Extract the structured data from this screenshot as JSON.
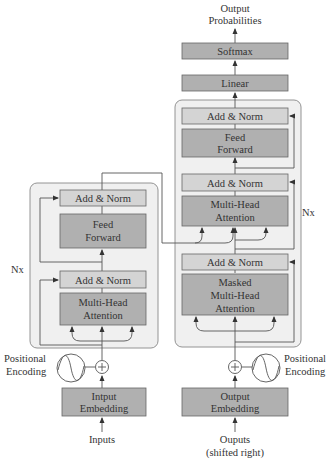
{
  "colors": {
    "stack_bg": "#f0f0f0",
    "light_block": "#d4d4d4",
    "dark_block": "#b0b0b0",
    "line": "#555555"
  },
  "top_output": {
    "line1": "Output",
    "line2": "Probabilities"
  },
  "decoder_head": {
    "softmax": "Softmax",
    "linear": "Linear"
  },
  "encoder": {
    "repeat_label": "Nx",
    "add_norm_top": "Add & Norm",
    "feed_forward": {
      "line1": "Feed",
      "line2": "Forward"
    },
    "add_norm_bottom": "Add & Norm",
    "attention": {
      "line1": "Multi-Head",
      "line2": "Attention"
    },
    "positional_encoding": {
      "line1": "Positional",
      "line2": "Encoding"
    },
    "embedding": {
      "line1": "Intput",
      "line2": "Embedding"
    },
    "input_label": "Inputs"
  },
  "decoder": {
    "repeat_label": "Nx",
    "add_norm_top": "Add & Norm",
    "feed_forward": {
      "line1": "Feed",
      "line2": "Forward"
    },
    "add_norm_middle": "Add & Norm",
    "attention": {
      "line1": "Multi-Head",
      "line2": "Attention"
    },
    "add_norm_bottom": "Add & Norm",
    "masked_attention": {
      "line1": "Masked",
      "line2": "Multi-Head",
      "line3": "Attention"
    },
    "positional_encoding": {
      "line1": "Positional",
      "line2": "Encoding"
    },
    "embedding": {
      "line1": "Output",
      "line2": "Embedding"
    },
    "input_label": {
      "line1": "Ouputs",
      "line2": "(shifted right)"
    }
  }
}
